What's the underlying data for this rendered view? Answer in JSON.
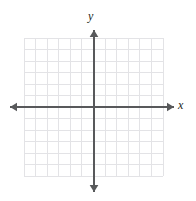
{
  "figure": {
    "kind": "cartesian-coordinate-plane",
    "background_color": "#ffffff",
    "width": 196,
    "height": 201
  },
  "labels": {
    "y_axis": "y",
    "x_axis": "x",
    "label_color": "#231f20"
  },
  "chart_data": {
    "type": "scatter",
    "title": "",
    "subtitle": "",
    "xlabel": "x",
    "ylabel": "y",
    "series": [
      {
        "name": "none",
        "x": [],
        "y": []
      }
    ],
    "xlim": [
      -6,
      6
    ],
    "ylim": [
      -6,
      6
    ],
    "xticks": [
      -6,
      -5,
      -4,
      -3,
      -2,
      -1,
      0,
      1,
      2,
      3,
      4,
      5,
      6
    ],
    "yticks": [
      -6,
      -5,
      -4,
      -3,
      -2,
      -1,
      0,
      1,
      2,
      3,
      4,
      5,
      6
    ],
    "xticklabels": [],
    "yticklabels": [],
    "grid": true,
    "grid_columns": 12,
    "grid_rows": 12,
    "legend": false,
    "legend_position": "none",
    "annotations": [],
    "axis_arrows": [
      "left",
      "right",
      "up",
      "down"
    ]
  },
  "geometry": {
    "grid": {
      "left": 24,
      "top": 38,
      "right": 163,
      "bottom": 176,
      "cell_width": 11.6,
      "cell_height": 11.5,
      "line_color": "#e3e3e6",
      "line_width": 1
    },
    "origin": {
      "x": 94,
      "y": 107
    },
    "axes": {
      "color": "#58595b",
      "line_width": 1.6,
      "x_start": 10,
      "x_end": 174,
      "y_start": 30,
      "y_end": 192,
      "arrow_size": 7
    }
  }
}
